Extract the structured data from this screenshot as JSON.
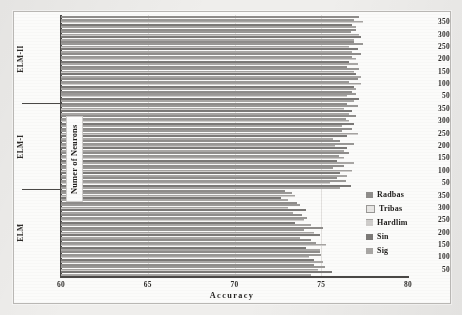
{
  "figure": {
    "xlabel": "Accuracy",
    "ylabel": "Numer of Neurons"
  },
  "legend": {
    "items": [
      {
        "label": "Radbas",
        "series": 0
      },
      {
        "label": "Tribas",
        "series": 1
      },
      {
        "label": "Hardlim",
        "series": 2
      },
      {
        "label": "Sin",
        "series": 3
      },
      {
        "label": "Sig",
        "series": 4
      }
    ]
  },
  "chart_data": {
    "type": "bar",
    "orientation": "horizontal",
    "title": "",
    "xlabel": "Accuracy",
    "ylabel": "Numer of Neurons",
    "xlim": [
      60,
      80
    ],
    "xticks": [
      60,
      65,
      70,
      75,
      80
    ],
    "grid": false,
    "legend_position": "right",
    "legend_entries": [
      "Radbas",
      "Tribas",
      "Hardlim",
      "Sin",
      "Sig"
    ],
    "categories": [
      50,
      100,
      150,
      200,
      250,
      300,
      350
    ],
    "groups": [
      {
        "name": "ELM",
        "series": [
          {
            "name": "Radbas",
            "values": [
              74.6,
              74.9,
              74.4,
              75.1,
              73.9,
              73.6,
              72.9
            ]
          },
          {
            "name": "Tribas",
            "values": [
              75.2,
              75.0,
              74.7,
              74.0,
              74.2,
              73.8,
              73.3
            ]
          },
          {
            "name": "Hardlim",
            "values": [
              74.8,
              74.3,
              75.3,
              74.6,
              74.0,
              73.1,
              73.5
            ]
          },
          {
            "name": "Sin",
            "values": [
              75.6,
              74.6,
              74.1,
              74.9,
              73.5,
              74.1,
              72.7
            ]
          },
          {
            "name": "Sig",
            "values": [
              74.4,
              75.1,
              74.9,
              73.8,
              74.4,
              73.4,
              73.1
            ]
          }
        ]
      },
      {
        "name": "ELM-I",
        "series": [
          {
            "name": "Radbas",
            "values": [
              75.9,
              76.3,
              76.6,
              76.1,
              76.8,
              77.0,
              76.5
            ]
          },
          {
            "name": "Tribas",
            "values": [
              76.4,
              75.7,
              76.0,
              76.9,
              76.2,
              76.4,
              77.1
            ]
          },
          {
            "name": "Hardlim",
            "values": [
              75.5,
              76.8,
              76.3,
              75.8,
              77.1,
              76.6,
              76.3
            ]
          },
          {
            "name": "Sin",
            "values": [
              76.7,
              76.1,
              75.9,
              76.5,
              76.5,
              76.9,
              76.8
            ]
          },
          {
            "name": "Sig",
            "values": [
              76.1,
              76.5,
              76.9,
              76.3,
              75.7,
              76.2,
              76.6
            ]
          }
        ]
      },
      {
        "name": "ELM-II",
        "series": [
          {
            "name": "Radbas",
            "values": [
              76.8,
              77.1,
              76.5,
              77.3,
              76.9,
              77.0,
              77.2
            ]
          },
          {
            "name": "Tribas",
            "values": [
              77.0,
              76.6,
              77.2,
              76.8,
              77.4,
              76.7,
              76.9
            ]
          },
          {
            "name": "Hardlim",
            "values": [
              76.5,
              77.3,
              76.9,
              77.0,
              76.6,
              77.2,
              77.4
            ]
          },
          {
            "name": "Sin",
            "values": [
              77.2,
              76.9,
              77.0,
              76.6,
              77.1,
              77.3,
              76.8
            ]
          },
          {
            "name": "Sig",
            "values": [
              76.9,
              77.0,
              77.3,
              77.1,
              76.8,
              76.9,
              77.0
            ]
          }
        ]
      }
    ]
  }
}
